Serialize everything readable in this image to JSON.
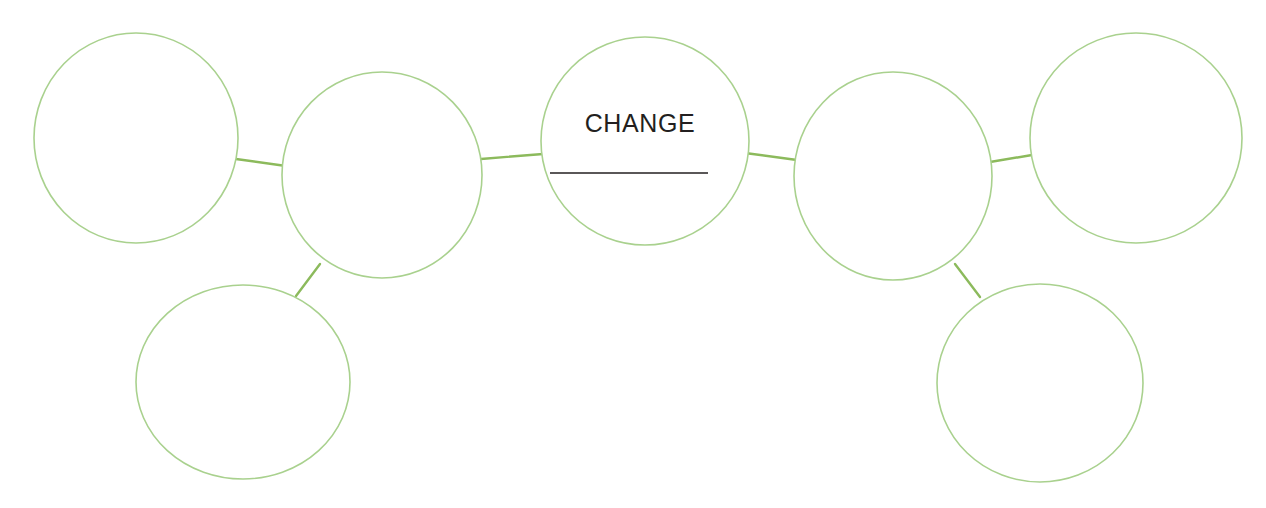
{
  "diagram": {
    "type": "cluster-web-organizer",
    "title": "CHANGE",
    "center_node": {
      "id": "center",
      "label": "CHANGE",
      "has_write_on_rule": true,
      "cx": 645,
      "cy": 141,
      "rx": 104,
      "ry": 104
    },
    "colors": {
      "circle_stroke": "#a9d18e",
      "connector_stroke": "#8cba5c",
      "text": "#231f20",
      "background": "#ffffff",
      "rule": "#231f20"
    },
    "nodes": [
      {
        "id": "node-far-left",
        "label": "",
        "cx": 136,
        "cy": 138,
        "rx": 102,
        "ry": 105
      },
      {
        "id": "node-left-inner",
        "label": "",
        "cx": 382,
        "cy": 175,
        "rx": 100,
        "ry": 103
      },
      {
        "id": "node-lower-left",
        "label": "",
        "cx": 243,
        "cy": 382,
        "rx": 107,
        "ry": 97
      },
      {
        "id": "node-right-inner",
        "label": "",
        "cx": 893,
        "cy": 176,
        "rx": 99,
        "ry": 104
      },
      {
        "id": "node-far-right",
        "label": "",
        "cx": 1136,
        "cy": 138,
        "rx": 106,
        "ry": 105
      },
      {
        "id": "node-lower-right",
        "label": "",
        "cx": 1040,
        "cy": 383,
        "rx": 103,
        "ry": 99
      }
    ],
    "connectors": [
      {
        "id": "conn-far-left-to-left-inner",
        "from": "node-far-left",
        "to": "node-left-inner",
        "x1": 236,
        "y1": 159,
        "x2": 286,
        "y2": 166
      },
      {
        "id": "conn-left-inner-to-center",
        "from": "node-left-inner",
        "to": "center",
        "x1": 481,
        "y1": 159,
        "x2": 543,
        "y2": 154
      },
      {
        "id": "conn-left-inner-to-lower-left",
        "from": "node-left-inner",
        "to": "node-lower-left",
        "x1": 320,
        "y1": 264,
        "x2": 296,
        "y2": 296
      },
      {
        "id": "conn-center-to-right-inner",
        "from": "center",
        "to": "node-right-inner",
        "x1": 745,
        "y1": 153,
        "x2": 797,
        "y2": 160
      },
      {
        "id": "conn-right-inner-to-far-right",
        "from": "node-right-inner",
        "to": "node-far-right",
        "x1": 990,
        "y1": 162,
        "x2": 1032,
        "y2": 155
      },
      {
        "id": "conn-right-inner-to-lower-rt",
        "from": "node-right-inner",
        "to": "node-lower-right",
        "x1": 955,
        "y1": 264,
        "x2": 980,
        "y2": 297
      }
    ],
    "center_rule": {
      "x1": 550,
      "y1": 173,
      "x2": 708,
      "y2": 173
    },
    "node_count": 7,
    "blank_node_count": 6
  }
}
